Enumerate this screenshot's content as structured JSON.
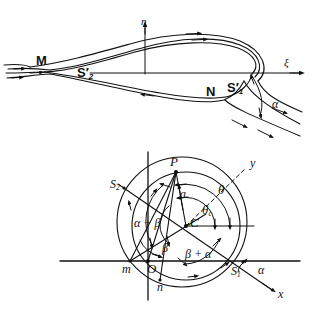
{
  "figure": {
    "stroke_color": "#111111",
    "background": "#ffffff"
  },
  "upper_diagram": {
    "name": "physical-plane-airfoil",
    "axes": {
      "vertical_label": "η",
      "horizontal_label": "ξ"
    },
    "labels": [
      {
        "id": "M",
        "text": "M",
        "sub": "",
        "prime": false,
        "bold": true
      },
      {
        "id": "S2prime",
        "text": "S",
        "sub": "2",
        "prime": true,
        "bold": true
      },
      {
        "id": "N",
        "text": "N",
        "sub": "",
        "prime": false,
        "bold": true
      },
      {
        "id": "S1prime",
        "text": "S",
        "sub": "1",
        "prime": true,
        "bold": true
      }
    ],
    "angle_label": "α"
  },
  "lower_diagram": {
    "name": "circle-plane",
    "axes": {
      "x_label": "x",
      "y_label": "y"
    },
    "points": [
      {
        "id": "P",
        "text": "P"
      },
      {
        "id": "C",
        "text": "C"
      },
      {
        "id": "O",
        "text": "O"
      },
      {
        "id": "m",
        "text": "m"
      },
      {
        "id": "n",
        "text": "n"
      },
      {
        "id": "S2",
        "text": "S",
        "sub": "2"
      },
      {
        "id": "S1",
        "text": "S",
        "sub": "1"
      }
    ],
    "segment_label": "a",
    "angles": [
      {
        "id": "theta",
        "text": "θ"
      },
      {
        "id": "theta-c",
        "text": "θ",
        "sub": "c"
      },
      {
        "id": "alpha-plus-beta",
        "text": "α + β"
      },
      {
        "id": "beta",
        "text": "β"
      },
      {
        "id": "beta-plus-alpha",
        "text": "β + α"
      },
      {
        "id": "alpha",
        "text": "α"
      }
    ]
  }
}
